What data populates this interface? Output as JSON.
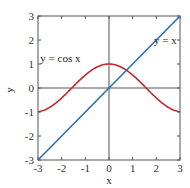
{
  "chart_data": {
    "type": "line",
    "title": "",
    "xlabel": "x",
    "ylabel": "y",
    "xlim": [
      -3,
      3
    ],
    "ylim": [
      -3,
      3
    ],
    "xticks": [
      -3,
      -2,
      -1,
      0,
      1,
      2,
      3
    ],
    "yticks": [
      -3,
      -2,
      -1,
      0,
      1,
      2,
      3
    ],
    "grid": false,
    "series": [
      {
        "name": "y = cos x",
        "color": "#c0282e",
        "function": "cos(x)",
        "x": [
          -3,
          -2.5,
          -2,
          -1.5,
          -1,
          -0.5,
          0,
          0.5,
          1,
          1.5,
          2,
          2.5,
          3
        ],
        "values": [
          -0.99,
          -0.8,
          -0.42,
          0.07,
          0.54,
          0.88,
          1.0,
          0.88,
          0.54,
          0.07,
          -0.42,
          -0.8,
          -0.99
        ]
      },
      {
        "name": "y = x",
        "color": "#2a6fb5",
        "function": "x",
        "x": [
          -3,
          3
        ],
        "values": [
          -3,
          3
        ]
      }
    ],
    "annotations": [
      {
        "text": "y = cos x",
        "x": -2.9,
        "y": 1.1
      },
      {
        "text": "y = x",
        "x": 1.9,
        "y": 1.85
      }
    ]
  }
}
